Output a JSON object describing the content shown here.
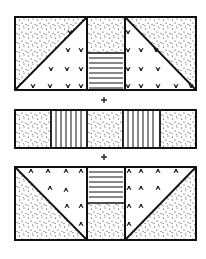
{
  "diagram": {
    "colors": {
      "ink": "#111111",
      "paper": "#ffffff"
    },
    "panels": [
      {
        "id": "top",
        "sections": [
          {
            "name": "left-square",
            "pattern": "diagonal split: stipple upper-left triangle, tuft marks lower-right triangle"
          },
          {
            "name": "center-strip",
            "pattern": "stipple top half, horizontal lines bottom half"
          },
          {
            "name": "right-square",
            "pattern": "diagonal split: stipple upper-right triangle, tuft marks lower-left triangle"
          }
        ]
      },
      {
        "id": "middle",
        "sections": [
          {
            "name": "block-1",
            "pattern": "stipple"
          },
          {
            "name": "block-2",
            "pattern": "vertical lines"
          },
          {
            "name": "block-3",
            "pattern": "stipple"
          },
          {
            "name": "block-4",
            "pattern": "vertical lines"
          },
          {
            "name": "block-5",
            "pattern": "stipple"
          }
        ]
      },
      {
        "id": "bottom",
        "sections": [
          {
            "name": "left-square",
            "pattern": "diagonal split: tuft marks upper-right triangle, stipple lower-left triangle"
          },
          {
            "name": "center-strip",
            "pattern": "horizontal lines top half, stipple bottom half"
          },
          {
            "name": "right-square",
            "pattern": "diagonal split: tuft marks upper-left triangle, stipple lower-right triangle"
          }
        ]
      }
    ],
    "operators": [
      "+",
      "+"
    ]
  }
}
